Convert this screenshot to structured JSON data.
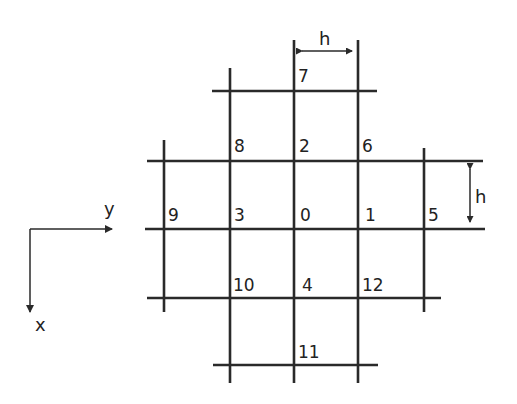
{
  "diagram": {
    "spacing_label": "h",
    "axes": {
      "horizontal_label": "y",
      "vertical_label": "x"
    },
    "nodes": [
      {
        "id": "0",
        "label": "0",
        "col": 0,
        "row": 0
      },
      {
        "id": "1",
        "label": "1",
        "col": 1,
        "row": 0
      },
      {
        "id": "2",
        "label": "2",
        "col": 0,
        "row": -1
      },
      {
        "id": "3",
        "label": "3",
        "col": -1,
        "row": 0
      },
      {
        "id": "4",
        "label": "4",
        "col": 0,
        "row": 1
      },
      {
        "id": "5",
        "label": "5",
        "col": 2,
        "row": 0
      },
      {
        "id": "6",
        "label": "6",
        "col": 1,
        "row": -1
      },
      {
        "id": "7",
        "label": "7",
        "col": 0,
        "row": -2
      },
      {
        "id": "8",
        "label": "8",
        "col": -1,
        "row": -1
      },
      {
        "id": "9",
        "label": "9",
        "col": -2,
        "row": 0
      },
      {
        "id": "10",
        "label": "10",
        "col": -1,
        "row": 1
      },
      {
        "id": "11",
        "label": "11",
        "col": 0,
        "row": 2
      },
      {
        "id": "12",
        "label": "12",
        "col": 1,
        "row": 1
      }
    ]
  }
}
